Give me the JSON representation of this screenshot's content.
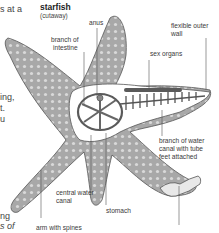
{
  "diagram": {
    "title": "starfish",
    "subtitle": "(cutaway)",
    "labels": {
      "anus": "anus",
      "branch_of_intestine_1": "branch of",
      "branch_of_intestine_2": "intestine",
      "flexible_outer_wall_1": "flexible outer",
      "flexible_outer_wall_2": "wall",
      "sex_organs": "sex organs",
      "branch_water_canal_1": "branch of water",
      "branch_water_canal_2": "canal with tube",
      "branch_water_canal_3": "feet attached",
      "central_water_canal_1": "central water",
      "central_water_canal_2": "canal",
      "stomach": "stomach",
      "arm_with_spines": "arm with spines"
    },
    "left_edge_text": {
      "line1": "s at a",
      "line2": "ing,",
      "line3": "t.",
      "line4": "u",
      "line5": "ng",
      "line6": "s of"
    },
    "colors": {
      "body_fill": "#a9a9a9",
      "body_dark": "#6e6e6e",
      "spot": "#d8d8d8",
      "cutaway_fill": "#ffffff",
      "organ": "#5a5a5a",
      "leader": "#555555"
    }
  }
}
